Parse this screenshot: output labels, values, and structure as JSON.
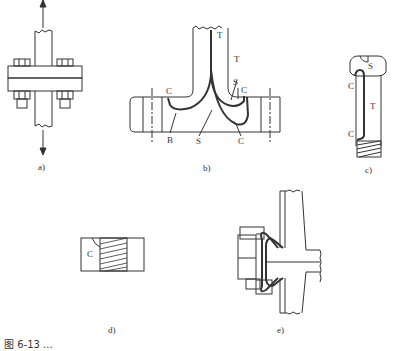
{
  "figure": {
    "caption": "图 6-13  ...",
    "panels": [
      {
        "id": "a",
        "label": "a)",
        "description": "Bolted flange joint under axial tension"
      },
      {
        "id": "b",
        "label": "b)",
        "description": "Flange-to-pipe weld cross section with labeled zones",
        "annotations": [
          "T",
          "T",
          "S",
          "C",
          "C",
          "B",
          "S",
          "C"
        ]
      },
      {
        "id": "c",
        "label": "c)",
        "description": "Bolt with hex head, threaded end",
        "annotations": [
          "S",
          "C",
          "T",
          "C"
        ]
      },
      {
        "id": "d",
        "label": "d)",
        "description": "Threaded nut section",
        "annotations": [
          "C"
        ]
      },
      {
        "id": "e",
        "label": "e)",
        "description": "Bolted flange connection with bellows/gasket section"
      }
    ]
  }
}
